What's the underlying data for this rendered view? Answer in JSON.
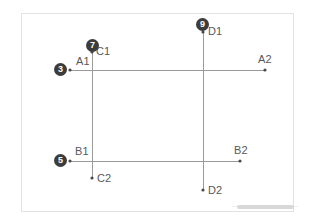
{
  "frame": {
    "border_color": "#e2e2e2",
    "background": "#ffffff",
    "x": 21,
    "y": 13,
    "width": 273,
    "height": 199
  },
  "style": {
    "line_color": "#9a9a9a",
    "dot_color": "#4a4a4a",
    "label_color": "#58585a",
    "badge_fill": "#3c3c3c",
    "badge_text_color": "#ffffff",
    "scrollbar_color": "#d8d8d8"
  },
  "chart_data": {
    "type": "scatter",
    "title": "",
    "xlabel": "",
    "ylabel": "",
    "grid": false,
    "legend": null,
    "segments": [
      {
        "name": "A",
        "orientation": "horizontal",
        "start": {
          "label": "A1",
          "x": 70,
          "y": 70
        },
        "end": {
          "label": "A2",
          "x": 265,
          "y": 70
        }
      },
      {
        "name": "B",
        "orientation": "horizontal",
        "start": {
          "label": "B1",
          "x": 70,
          "y": 161
        },
        "end": {
          "label": "B2",
          "x": 240,
          "y": 161
        }
      },
      {
        "name": "C",
        "orientation": "vertical",
        "start": {
          "label": "C1",
          "x": 92,
          "y": 52
        },
        "end": {
          "label": "C2",
          "x": 92,
          "y": 178
        }
      },
      {
        "name": "D",
        "orientation": "vertical",
        "start": {
          "label": "D1",
          "x": 203,
          "y": 32
        },
        "end": {
          "label": "D2",
          "x": 203,
          "y": 190
        }
      }
    ],
    "points": [
      {
        "label": "A1",
        "x": 70,
        "y": 70,
        "label_dx": 6,
        "label_dy": -14
      },
      {
        "label": "A2",
        "x": 265,
        "y": 70,
        "label_dx": -7,
        "label_dy": -16
      },
      {
        "label": "B1",
        "x": 70,
        "y": 161,
        "label_dx": 5,
        "label_dy": -15
      },
      {
        "label": "B2",
        "x": 240,
        "y": 161,
        "label_dx": -6,
        "label_dy": -16
      },
      {
        "label": "C1",
        "x": 92,
        "y": 52,
        "label_dx": 4,
        "label_dy": -6
      },
      {
        "label": "C2",
        "x": 92,
        "y": 178,
        "label_dx": 5,
        "label_dy": -5
      },
      {
        "label": "D1",
        "x": 203,
        "y": 32,
        "label_dx": 5,
        "label_dy": -6
      },
      {
        "label": "D2",
        "x": 203,
        "y": 190,
        "label_dx": 5,
        "label_dy": -5
      }
    ],
    "badges": [
      {
        "number": "3",
        "at_point": "A1",
        "x": 54,
        "y": 63
      },
      {
        "number": "7",
        "at_point": "C1",
        "x": 86,
        "y": 39
      },
      {
        "number": "9",
        "at_point": "D1",
        "x": 196,
        "y": 18
      },
      {
        "number": "5",
        "at_point": "B1",
        "x": 54,
        "y": 154
      }
    ]
  },
  "labels": {
    "a1": "A1",
    "a2": "A2",
    "b1": "B1",
    "b2": "B2",
    "c1": "C1",
    "c2": "C2",
    "d1": "D1",
    "d2": "D2"
  },
  "badges": {
    "three": "3",
    "five": "5",
    "seven": "7",
    "nine": "9"
  }
}
